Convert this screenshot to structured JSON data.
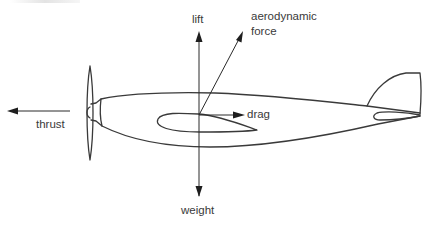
{
  "diagram": {
    "labels": {
      "lift": "lift",
      "aerodynamic_force_line1": "aerodynamic",
      "aerodynamic_force_line2": "force",
      "drag": "drag",
      "thrust": "thrust",
      "weight": "weight"
    },
    "forces": [
      {
        "name": "lift",
        "direction": "up",
        "origin": [
          199,
          115
        ],
        "tip": [
          199,
          32
        ]
      },
      {
        "name": "aerodynamic force",
        "direction": "up-right",
        "origin": [
          199,
          115
        ],
        "tip": [
          243,
          32
        ]
      },
      {
        "name": "drag",
        "direction": "right",
        "origin": [
          199,
          115
        ],
        "tip": [
          244,
          115
        ]
      },
      {
        "name": "weight",
        "direction": "down",
        "origin": [
          199,
          115
        ],
        "tip": [
          199,
          196
        ]
      },
      {
        "name": "thrust",
        "direction": "left",
        "origin": [
          70,
          111
        ],
        "tip": [
          8,
          111
        ]
      }
    ],
    "components": [
      "propeller",
      "spinner",
      "fuselage",
      "wing",
      "tail-fin",
      "tailplane"
    ],
    "colors": {
      "line": "#3a3a3a",
      "arrowhead": "#1e1e1e",
      "background": "#ffffff"
    }
  }
}
